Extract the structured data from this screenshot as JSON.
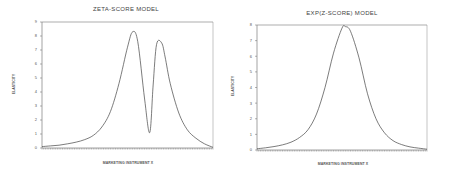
{
  "chart_data": [
    {
      "type": "line",
      "title": "ZETA-SCORE MODEL",
      "xlabel": "MARKETING INSTRUMENT X",
      "ylabel": "ELASTICITY",
      "ylim": [
        0,
        9
      ],
      "yticks": [
        "0",
        "1",
        "2",
        "3",
        "4",
        "5",
        "6",
        "7",
        "8",
        "9"
      ],
      "grid": false,
      "x": [
        0,
        0.05,
        0.1,
        0.15,
        0.2,
        0.25,
        0.3,
        0.35,
        0.4,
        0.45,
        0.5,
        0.53,
        0.56,
        0.6,
        0.63,
        0.65,
        0.67,
        0.7,
        0.72,
        0.75,
        0.8,
        0.85,
        0.9,
        0.95,
        1.0
      ],
      "series": [
        {
          "name": "Zeta-score elasticity",
          "values": [
            0.1,
            0.15,
            0.2,
            0.3,
            0.42,
            0.6,
            0.9,
            1.5,
            2.6,
            4.6,
            7.2,
            8.3,
            7.6,
            3.5,
            1.1,
            4.5,
            7.4,
            7.5,
            6.5,
            4.6,
            2.5,
            1.3,
            0.7,
            0.3,
            0.05
          ]
        }
      ]
    },
    {
      "type": "line",
      "title": "EXP(Z-SCORE) MODEL",
      "xlabel": "MARKETING INSTRUMENT X",
      "ylabel": "ELASTICITY",
      "ylim": [
        0,
        8
      ],
      "yticks": [
        "0",
        "1",
        "2",
        "3",
        "4",
        "5",
        "6",
        "7",
        "8"
      ],
      "grid": false,
      "x": [
        0,
        0.05,
        0.1,
        0.15,
        0.2,
        0.25,
        0.3,
        0.35,
        0.4,
        0.45,
        0.5,
        0.52,
        0.55,
        0.6,
        0.65,
        0.7,
        0.75,
        0.8,
        0.85,
        0.9,
        0.95,
        1.0
      ],
      "series": [
        {
          "name": "Exp(z-score) elasticity",
          "values": [
            0.08,
            0.14,
            0.22,
            0.33,
            0.5,
            0.8,
            1.3,
            2.3,
            4.0,
            6.2,
            7.8,
            7.9,
            7.6,
            5.9,
            3.6,
            2.0,
            1.1,
            0.6,
            0.35,
            0.2,
            0.12,
            0.05
          ]
        }
      ]
    }
  ]
}
